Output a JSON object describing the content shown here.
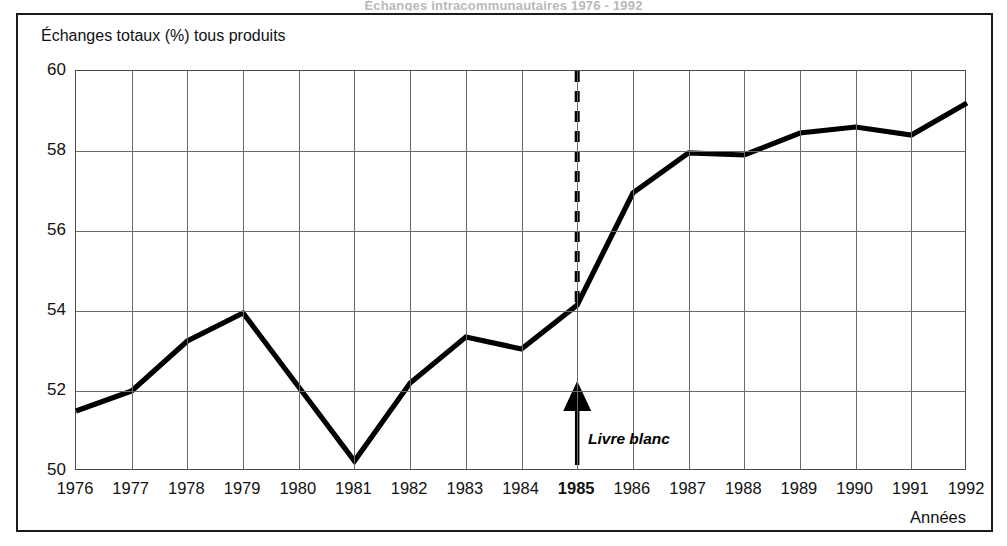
{
  "figure": {
    "caption": "Échanges totaux (%) tous produits",
    "cut_title": "Échanges intracommunautaires 1976 - 1992",
    "axis_name": "Années"
  },
  "annotation": {
    "label": "Livre blanc",
    "at_year": 1985,
    "marker": "dashed-vertical-line-with-up-arrow"
  },
  "colors": {
    "line": "#000000",
    "grid": "#6a6a6a",
    "frame": "#1a1a1a",
    "background": "#ffffff"
  },
  "chart_data": {
    "type": "line",
    "title": "Échanges totaux (%) tous produits",
    "xlabel": "Années",
    "ylabel": "Échanges totaux (%) tous produits",
    "ylim": [
      50,
      60
    ],
    "yticks": [
      50,
      52,
      54,
      56,
      58,
      60
    ],
    "xlim": [
      1976,
      1992
    ],
    "grid": true,
    "legend": null,
    "categories": [
      1976,
      1977,
      1978,
      1979,
      1980,
      1981,
      1982,
      1983,
      1984,
      1985,
      1986,
      1987,
      1988,
      1989,
      1990,
      1991,
      1992
    ],
    "xticklabels": [
      "1976",
      "1977",
      "1978",
      "1979",
      "1980",
      "1981",
      "1982",
      "1983",
      "1984",
      "1985",
      "1986",
      "1987",
      "1988",
      "1989",
      "1990",
      "1991",
      "1992"
    ],
    "highlight_xtick": "1985",
    "values": [
      51.5,
      52.0,
      53.25,
      53.95,
      52.1,
      50.25,
      52.2,
      53.35,
      53.05,
      54.15,
      56.95,
      57.95,
      57.9,
      58.45,
      58.6,
      58.4,
      59.2
    ],
    "annotations": [
      {
        "text": "Livre blanc",
        "x": 1985,
        "y": 51.3,
        "style": "bold-italic",
        "arrow": "up"
      }
    ]
  }
}
